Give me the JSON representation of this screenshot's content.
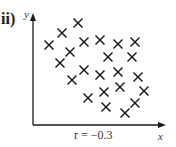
{
  "part_label": "ii)",
  "chart_data": {
    "type": "scatter",
    "title": "",
    "xlabel": "x",
    "ylabel": "y",
    "annotation": "r = −0.3",
    "marker": "cross",
    "grid": false,
    "legend": null,
    "points_px": [
      [
        49,
        45
      ],
      [
        62,
        33
      ],
      [
        78,
        23
      ],
      [
        70,
        52
      ],
      [
        84,
        42
      ],
      [
        100,
        40
      ],
      [
        60,
        63
      ],
      [
        84,
        70
      ],
      [
        72,
        80
      ],
      [
        118,
        44
      ],
      [
        135,
        42
      ],
      [
        108,
        57
      ],
      [
        132,
        57
      ],
      [
        100,
        75
      ],
      [
        118,
        72
      ],
      [
        138,
        77
      ],
      [
        104,
        92
      ],
      [
        120,
        87
      ],
      [
        144,
        91
      ],
      [
        88,
        98
      ],
      [
        106,
        107
      ],
      [
        135,
        103
      ],
      [
        125,
        113
      ]
    ],
    "axis_origin_px": [
      33,
      125
    ],
    "correlation": -0.3
  },
  "colors": {
    "ink": "#1a1a1a",
    "background": "#ffffff"
  }
}
